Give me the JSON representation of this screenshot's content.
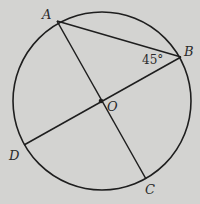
{
  "diagram": {
    "background": "#d3d3d1",
    "stroke_color": "#1e1e1e",
    "circle": {
      "center": "O",
      "cx": 102,
      "cy": 101,
      "r": 89
    },
    "points": {
      "A": {
        "label": "A",
        "x": 57,
        "y": 21
      },
      "B": {
        "label": "B",
        "x": 181,
        "y": 57
      },
      "C": {
        "label": "C",
        "x": 146,
        "y": 179
      },
      "D": {
        "label": "D",
        "x": 24,
        "y": 145
      },
      "O": {
        "label": "O",
        "x": 101,
        "y": 101
      }
    },
    "segments": [
      {
        "from": "A",
        "to": "B"
      },
      {
        "from": "A",
        "to": "C",
        "through": "O"
      },
      {
        "from": "B",
        "to": "D",
        "through": "O"
      }
    ],
    "angle_label": {
      "vertex": "B",
      "text": "45°"
    }
  }
}
